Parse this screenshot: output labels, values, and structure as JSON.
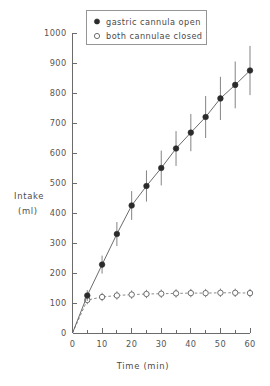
{
  "chart_data": {
    "type": "line",
    "title": "",
    "xlabel": "Time (min)",
    "ylabel": "Intake (ml)",
    "ylabel_line1": "Intake",
    "ylabel_line2": "(ml)",
    "xlim": [
      0,
      60
    ],
    "ylim": [
      0,
      1000
    ],
    "grid": false,
    "legend_position": "top-center",
    "x_major_ticks": [
      0,
      10,
      20,
      30,
      40,
      50,
      60
    ],
    "x_major_tick_labels": [
      "0",
      "10",
      "20",
      "30",
      "40",
      "50",
      "60"
    ],
    "x_minor_ticks": [
      5,
      15,
      25,
      35,
      45,
      55
    ],
    "y_major_ticks": [
      0,
      100,
      200,
      300,
      400,
      500,
      600,
      700,
      800,
      900,
      1000
    ],
    "y_major_tick_labels": [
      "0",
      "100",
      "200",
      "300",
      "400",
      "500",
      "600",
      "700",
      "800",
      "900",
      "1000"
    ],
    "series": [
      {
        "name": "gastric cannula open",
        "marker": "filled-circle",
        "line_style": "solid",
        "x": [
          5,
          10,
          15,
          20,
          25,
          30,
          35,
          40,
          45,
          50,
          55,
          60
        ],
        "values": [
          125,
          228,
          330,
          425,
          490,
          550,
          615,
          668,
          720,
          782,
          827,
          875
        ],
        "error": [
          18,
          30,
          40,
          48,
          52,
          58,
          58,
          62,
          70,
          72,
          78,
          82
        ]
      },
      {
        "name": "both cannulae closed",
        "marker": "open-circle",
        "line_style": "dashed",
        "x": [
          5,
          10,
          15,
          20,
          25,
          30,
          35,
          40,
          45,
          50,
          55,
          60
        ],
        "values": [
          110,
          120,
          125,
          128,
          130,
          131,
          132,
          133,
          133,
          134,
          134,
          133
        ],
        "error": [
          14,
          14,
          14,
          14,
          14,
          14,
          14,
          14,
          14,
          14,
          14,
          14
        ]
      }
    ]
  },
  "legend": {
    "entries": [
      {
        "label": "gastric cannula open",
        "marker": "filled-circle"
      },
      {
        "label": "both cannulae closed",
        "marker": "open-circle"
      }
    ]
  },
  "colors": {
    "axis": "#6b6b6b",
    "filled_marker": "#2b2b2b",
    "open_marker_stroke": "#5f5f5f",
    "solid_line": "#5a5a5a",
    "dashed_line": "#7d7d7d",
    "text": "#4a4a4a",
    "background": "#ffffff"
  }
}
